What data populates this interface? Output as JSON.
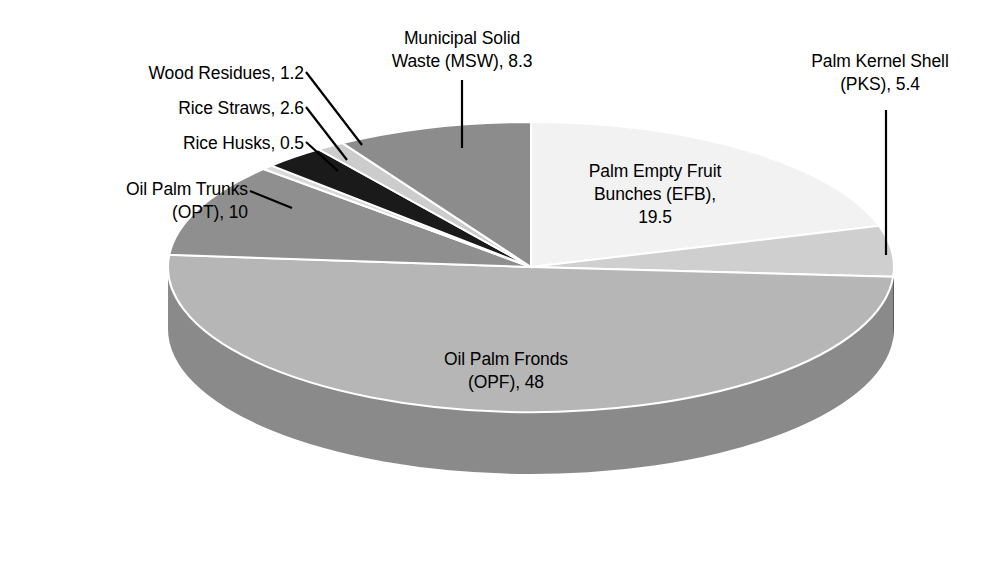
{
  "chart_data": {
    "type": "pie",
    "title": "",
    "unit": "",
    "three_d": true,
    "start_angle_deg": 0,
    "legend": "none",
    "categories": [
      "Palm Empty Fruit Bunches (EFB)",
      "Palm Kernel Shell (PKS)",
      "Oil Palm Fronds (OPF)",
      "Oil Palm Trunks (OPT)",
      "Rice Husks",
      "Rice Straws",
      "Wood Residues",
      "Municipal Solid Waste (MSW)"
    ],
    "values": [
      19.5,
      5.4,
      48,
      10,
      0.5,
      2.6,
      1.2,
      8.3
    ],
    "slices": [
      {
        "key": "efb",
        "label": "Palm Empty Fruit Bunches (EFB)",
        "value": 19.5,
        "color": "#f2f2f2",
        "side_color": "#d2d2d2"
      },
      {
        "key": "pks",
        "label": "Palm Kernel Shell (PKS)",
        "value": 5.4,
        "color": "#cfcfcf",
        "side_color": "#2f2f2f"
      },
      {
        "key": "opf",
        "label": "Oil Palm Fronds (OPF)",
        "value": 48,
        "color": "#b6b6b6",
        "side_color": "#8a8a8a"
      },
      {
        "key": "opt",
        "label": "Oil Palm Trunks (OPT)",
        "value": 10,
        "color": "#8f8f8f",
        "side_color": "#6e6e6e"
      },
      {
        "key": "husk",
        "label": "Rice Husks",
        "value": 0.5,
        "color": "#d9d9d9",
        "side_color": "#b0b0b0"
      },
      {
        "key": "straw",
        "label": "Rice Straws",
        "value": 2.6,
        "color": "#1a1a1a",
        "side_color": "#101010"
      },
      {
        "key": "wood",
        "label": "Wood Residues",
        "value": 1.2,
        "color": "#cccccc",
        "side_color": "#a6a6a6"
      },
      {
        "key": "msw",
        "label": "Municipal Solid Waste (MSW)",
        "value": 8.3,
        "color": "#8c8c8c",
        "side_color": "#6b6b6b"
      }
    ]
  },
  "labels": {
    "msw": {
      "line1": "Municipal Solid",
      "line2": "Waste (MSW), 8.3",
      "text": "Municipal Solid\nWaste (MSW), 8.3"
    },
    "wood": {
      "text": "Wood Residues, 1.2"
    },
    "straw": {
      "text": "Rice Straws, 2.6"
    },
    "husk": {
      "text": "Rice Husks, 0.5"
    },
    "opt": {
      "line1": "Oil Palm Trunks",
      "line2": "(OPT), 10",
      "text": "Oil Palm Trunks\n(OPT), 10"
    },
    "pks": {
      "line1": "Palm Kernel Shell",
      "line2": "(PKS), 5.4",
      "text": "Palm Kernel Shell\n(PKS), 5.4"
    },
    "efb": {
      "line1": "Palm Empty Fruit",
      "line2": "Bunches (EFB),",
      "line3": "19.5",
      "text": "Palm Empty Fruit\nBunches (EFB),\n19.5"
    },
    "opf": {
      "line1": "Oil Palm Fronds",
      "line2": "(OPF), 48",
      "text": "Oil Palm Fronds\n(OPF), 48"
    }
  },
  "colors": {
    "background": "#ffffff",
    "text": "#000000",
    "leader_line": "#000000",
    "slice_separator": "#ffffff"
  }
}
